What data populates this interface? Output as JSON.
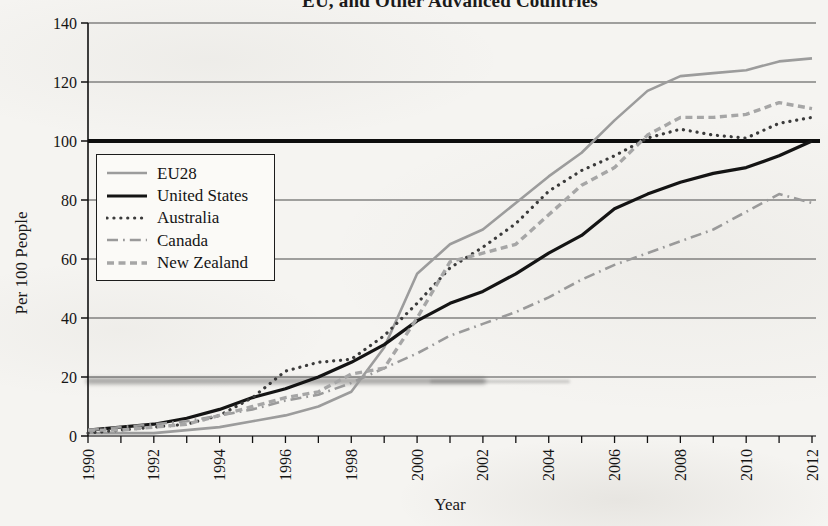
{
  "page": {
    "background": "#f5f4f1",
    "style": "scanned-book-figure"
  },
  "title": {
    "text": "EU, and Other Advanced Countries",
    "clipped_at_top": true
  },
  "axes": {
    "y_label": "Per 100 People",
    "x_label": "Year",
    "y_tick_labels": [
      "0",
      "20",
      "40",
      "60",
      "80",
      "100",
      "120",
      "140"
    ],
    "x_tick_labels": [
      "1990",
      "1992",
      "1994",
      "1996",
      "1998",
      "2000",
      "2002",
      "2004",
      "2006",
      "2008",
      "2010",
      "2012"
    ]
  },
  "legend": {
    "position": "upper-left-inside",
    "border_color": "#1c1c1c",
    "items": [
      "EU28",
      "United States",
      "Australia",
      "Canada",
      "New Zealand"
    ]
  },
  "chart_data": {
    "type": "line",
    "title": "EU, and Other Advanced Countries",
    "xlabel": "Year",
    "ylabel": "Per 100 People",
    "xlim": [
      1990,
      2012
    ],
    "ylim": [
      0,
      140
    ],
    "y_ticks": [
      0,
      20,
      40,
      60,
      80,
      100,
      120,
      140
    ],
    "x_major_ticks": [
      1990,
      1992,
      1994,
      1996,
      1998,
      2000,
      2002,
      2004,
      2006,
      2008,
      2010,
      2012
    ],
    "x_minor_tick_interval": 1,
    "reference_line_y": 100,
    "grid": "horizontal",
    "legend_position": "upper-left-inside",
    "x": [
      1990,
      1991,
      1992,
      1993,
      1994,
      1995,
      1996,
      1997,
      1998,
      1999,
      2000,
      2001,
      2002,
      2003,
      2004,
      2005,
      2006,
      2007,
      2008,
      2009,
      2010,
      2011,
      2012
    ],
    "series": [
      {
        "name": "EU28",
        "color": "#9c9c9c",
        "style": "solid",
        "width": 2.6,
        "values": [
          1,
          1,
          1,
          2,
          3,
          5,
          7,
          10,
          15,
          30,
          55,
          65,
          70,
          79,
          88,
          96,
          107,
          117,
          122,
          123,
          124,
          127,
          128
        ]
      },
      {
        "name": "United States",
        "color": "#141414",
        "style": "solid",
        "width": 3.2,
        "values": [
          2,
          3,
          4,
          6,
          9,
          13,
          16,
          20,
          25,
          31,
          39,
          45,
          49,
          55,
          62,
          68,
          77,
          82,
          86,
          89,
          91,
          95,
          100
        ]
      },
      {
        "name": "Australia",
        "color": "#3b3b3b",
        "style": "dotted",
        "width": 3.2,
        "values": [
          1,
          2,
          3,
          4,
          7,
          13,
          22,
          25,
          26,
          34,
          45,
          57,
          64,
          72,
          83,
          90,
          95,
          101,
          104,
          102,
          101,
          106,
          108
        ]
      },
      {
        "name": "Canada",
        "color": "#9a9a9a",
        "style": "dashdot",
        "width": 2.6,
        "values": [
          2,
          3,
          4,
          5,
          7,
          9,
          12,
          14,
          18,
          23,
          28,
          34,
          38,
          42,
          47,
          53,
          58,
          62,
          66,
          70,
          76,
          82,
          79
        ]
      },
      {
        "name": "New Zealand",
        "color": "#a6a6a6",
        "style": "dashed",
        "width": 3.4,
        "values": [
          2,
          2,
          3,
          4,
          7,
          10,
          13,
          15,
          21,
          23,
          40,
          59,
          62,
          65,
          75,
          85,
          91,
          102,
          108,
          108,
          109,
          113,
          111
        ]
      }
    ]
  }
}
